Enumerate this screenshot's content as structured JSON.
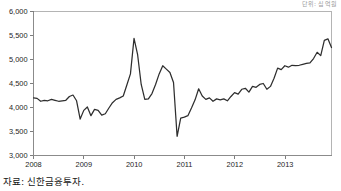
{
  "figure": {
    "corner_note": "단위: 십억원",
    "source_note": "자료: 신한금융투자.",
    "line_color": "#2e2e2e",
    "axis_color": "#8b8b8b"
  },
  "chart_data": {
    "type": "line",
    "title": "",
    "subtitle": "",
    "xlabel": "",
    "ylabel": "",
    "grid": false,
    "legend": false,
    "legend_position": "none",
    "ylim": [
      3000,
      6000
    ],
    "ytick_labels": [
      "3,000",
      "3,500",
      "4,000",
      "4,500",
      "5,000",
      "5,500",
      "6,000"
    ],
    "yticks": [
      3000,
      3500,
      4000,
      4500,
      5000,
      5500,
      6000
    ],
    "xtick_labels": [
      "2008",
      "2009",
      "2010",
      "2011",
      "2012",
      "2013"
    ],
    "xticks": [
      2008,
      2009,
      2010,
      2011,
      2012,
      2013
    ],
    "xlim": [
      2008.0,
      2013.92
    ],
    "series": [
      {
        "name": "series-1",
        "color": "#2e2e2e",
        "x": [
          2008.0,
          2008.08,
          2008.17,
          2008.25,
          2008.33,
          2008.42,
          2008.5,
          2008.58,
          2008.67,
          2008.75,
          2008.83,
          2008.92,
          2009.0,
          2009.08,
          2009.17,
          2009.25,
          2009.33,
          2009.42,
          2009.5,
          2009.58,
          2009.67,
          2009.75,
          2009.83,
          2009.92,
          2010.0,
          2010.08,
          2010.17,
          2010.25,
          2010.33,
          2010.42,
          2010.5,
          2010.58,
          2010.67,
          2010.75,
          2010.83,
          2010.92,
          2011.0,
          2011.08,
          2011.17,
          2011.25,
          2011.33,
          2011.42,
          2011.5,
          2011.58,
          2011.67,
          2011.75,
          2011.83,
          2011.92,
          2012.0,
          2012.08,
          2012.17,
          2012.25,
          2012.33,
          2012.42,
          2012.5,
          2012.58,
          2012.67,
          2012.75,
          2012.83,
          2012.92,
          2013.0,
          2013.08,
          2013.17,
          2013.25,
          2013.33,
          2013.42,
          2013.5,
          2013.58,
          2013.67,
          2013.75,
          2013.83,
          2013.92
        ],
        "values": [
          4200,
          4190,
          4130,
          4150,
          4140,
          4170,
          4150,
          4130,
          4140,
          4150,
          4230,
          4260,
          4140,
          3760,
          3940,
          4010,
          3830,
          3960,
          3940,
          3840,
          3870,
          3990,
          4100,
          4170,
          4200,
          4240,
          4470,
          4700,
          5440,
          5100,
          4480,
          4170,
          4180,
          4290,
          4480,
          4700,
          4870,
          4800,
          4730,
          4520,
          3400,
          3780,
          3800,
          3830,
          3990,
          4160,
          4390,
          4240,
          4170,
          4200,
          4130,
          4180,
          4160,
          4180,
          4140,
          4230,
          4310,
          4280,
          4380,
          4400,
          4320,
          4440,
          4420,
          4480,
          4500,
          4380,
          4440,
          4610,
          4820,
          4790,
          4870,
          4840
        ],
        "values_tail": [
          4880,
          4870,
          4880,
          4900,
          4920,
          4930,
          5020,
          5150,
          5080,
          5400,
          5430,
          5250
        ]
      }
    ],
    "peak_value": 5440,
    "trough_value": 3400,
    "start_value": 4200,
    "end_value": 5250
  }
}
